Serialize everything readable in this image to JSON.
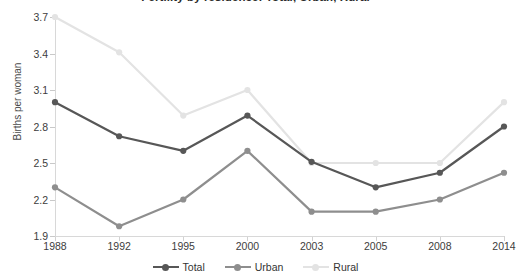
{
  "title": "Fertility by residence: Total, Urban, Rural",
  "axes": {
    "ylabel": "Births per woman",
    "yticks": [
      "1.9",
      "2.2",
      "2.5",
      "2.8",
      "3.1",
      "3.4",
      "3.7"
    ],
    "xticks": [
      "1988",
      "1992",
      "1995",
      "2000",
      "2003",
      "2005",
      "2008",
      "2014"
    ]
  },
  "legend": {
    "items": [
      {
        "label": "Total",
        "color": "#575757"
      },
      {
        "label": "Urban",
        "color": "#8e8e8e"
      },
      {
        "label": "Rural",
        "color": "#e3e3e3"
      }
    ]
  },
  "chart_data": {
    "type": "line",
    "title": "Fertility by residence: Total, Urban, Rural",
    "xlabel": "",
    "ylabel": "Births per woman",
    "categories": [
      "1988",
      "1992",
      "1995",
      "2000",
      "2003",
      "2005",
      "2008",
      "2014"
    ],
    "ylim": [
      1.9,
      3.7
    ],
    "ytick_step": 0.3,
    "grid": false,
    "legend_position": "bottom",
    "series": [
      {
        "name": "Total",
        "color": "#575757",
        "values": [
          3.0,
          2.72,
          2.6,
          2.89,
          2.51,
          2.3,
          2.42,
          2.8
        ]
      },
      {
        "name": "Urban",
        "color": "#8e8e8e",
        "values": [
          2.3,
          1.98,
          2.2,
          2.6,
          2.1,
          2.1,
          2.2,
          2.42
        ]
      },
      {
        "name": "Rural",
        "color": "#e3e3e3",
        "values": [
          3.7,
          3.41,
          2.89,
          3.1,
          2.5,
          2.5,
          2.5,
          3.0
        ]
      }
    ]
  }
}
